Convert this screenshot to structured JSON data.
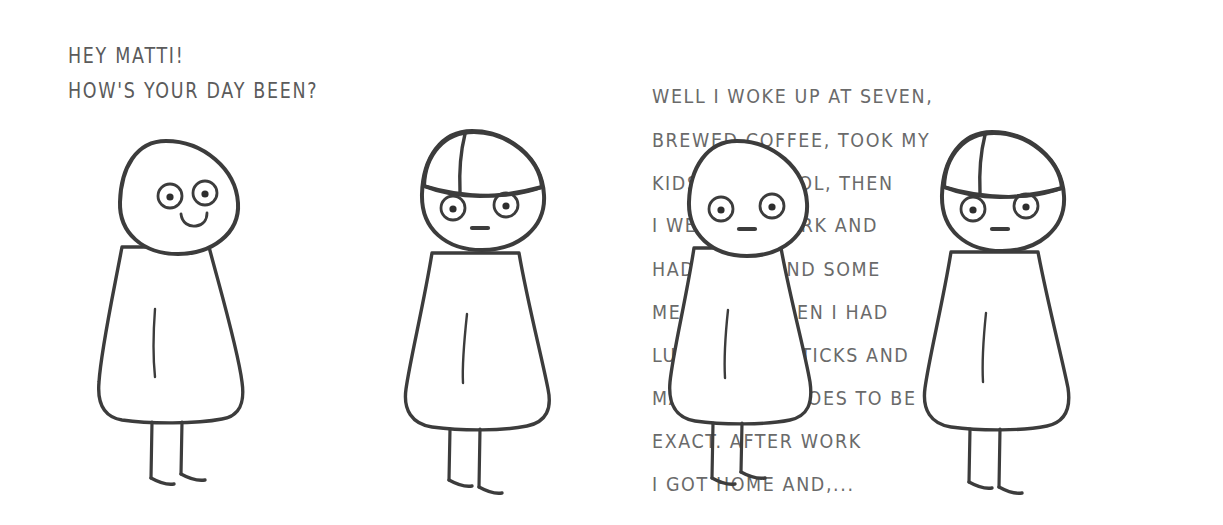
{
  "comic": {
    "title": "Hey Matti comic strip",
    "background_color": "#ffffff",
    "ink_color": "#3c3c3c",
    "text_color": "#5b5b5b",
    "panel_count": 4
  },
  "panels": [
    {
      "id": "panel-1",
      "caption": "HEY MATTI!\nHOW'S YOUR DAY BEEN?",
      "character": {
        "name": "bald-character",
        "hat": false,
        "expression": "smiling",
        "mouth": "smile"
      }
    },
    {
      "id": "panel-2",
      "caption": "WELL I WOKE UP AT SEVEN,\nBREWED COFFEE, TOOK MY\nKIDS TO SCHOOL, THEN\nI WENT TO WORK AND\nHAD TO ATTEND SOME\nMEETINGS. THEN I HAD\nLUNCH, FISH STICKS AND\nMASHED POTATOES TO BE\nEXACT. AFTER WORK\nI GOT HOME AND,...",
      "character": {
        "name": "matti-character",
        "hat": true,
        "expression": "neutral",
        "mouth": "flat"
      }
    },
    {
      "id": "panel-3",
      "caption": "",
      "character": {
        "name": "bald-character",
        "hat": false,
        "expression": "neutral",
        "mouth": "flat"
      }
    },
    {
      "id": "panel-4",
      "caption": "YOU DIDN'T WANT TO KNOW\nLITERALLY, DID YOU?",
      "character": {
        "name": "matti-character",
        "hat": true,
        "expression": "neutral",
        "mouth": "flat"
      }
    }
  ]
}
